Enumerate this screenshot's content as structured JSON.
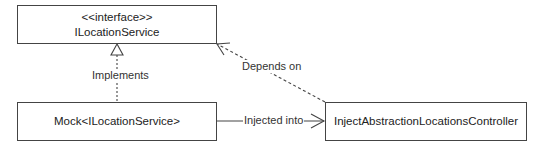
{
  "diagram": {
    "type": "uml-class-diagram",
    "nodes": [
      {
        "id": "interface",
        "stereotype": "<<interface>>",
        "name": "ILocationService"
      },
      {
        "id": "mock",
        "name": "Mock<ILocationService>"
      },
      {
        "id": "controller",
        "name": "InjectAbstractionLocationsController"
      }
    ],
    "edges": [
      {
        "from": "mock",
        "to": "interface",
        "label": "Implements",
        "style": "dashed",
        "arrow": "hollow-triangle"
      },
      {
        "from": "controller",
        "to": "interface",
        "label": "Depends on",
        "style": "dashed",
        "arrow": "open"
      },
      {
        "from": "mock",
        "to": "controller",
        "label": "Injected into",
        "style": "solid",
        "arrow": "open"
      }
    ]
  },
  "colors": {
    "stroke": "#444444",
    "text": "#222222",
    "background": "#ffffff"
  }
}
